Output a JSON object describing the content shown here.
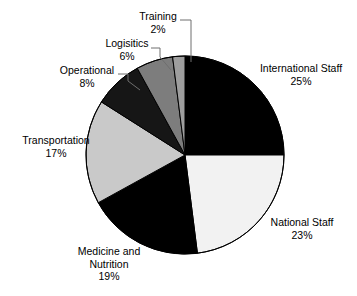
{
  "chart_data": {
    "type": "pie",
    "title": "",
    "subtitle": "",
    "legend": "none",
    "labels_show_percent": true,
    "start_angle_deg": 0,
    "direction": "clockwise",
    "categories": [
      "International Staff",
      "National Staff",
      "Medicine and Nutrition",
      "Transportation",
      "Operational",
      "Logisitics",
      "Training"
    ],
    "values": [
      25,
      23,
      19,
      17,
      8,
      6,
      2
    ],
    "percent_labels": [
      "25%",
      "23%",
      "19%",
      "17%",
      "8%",
      "6%",
      "2%"
    ],
    "slice_colors": [
      "#000000",
      "#f2f2f2",
      "#000000",
      "#c9c9c9",
      "#161616",
      "#7d7d7d",
      "#9e9e9e"
    ],
    "slice_edge_color": "#000000",
    "background_color": "#ffffff",
    "text_color": "#000000",
    "leader_line_color": "#6e6e6e"
  },
  "slices": {
    "international": {
      "name": "International Staff",
      "pct": "25%"
    },
    "national": {
      "name": "National Staff",
      "pct": "23%"
    },
    "medicine": {
      "name_line1": "Medicine and",
      "name_line2": "Nutrition",
      "pct": "19%"
    },
    "transportation": {
      "name": "Transportation",
      "pct": "17%"
    },
    "operational": {
      "name": "Operational",
      "pct": "8%"
    },
    "logistics": {
      "name": "Logisitics",
      "pct": "6%"
    },
    "training": {
      "name": "Training",
      "pct": "2%"
    }
  }
}
